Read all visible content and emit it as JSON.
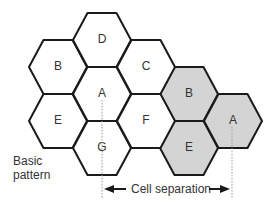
{
  "diagram": {
    "type": "hexagonal cellular frequency reuse pattern",
    "colors": {
      "cell_stroke": "#1a1a1a",
      "basic_fill": "#ffffff",
      "reuse_fill": "#d4d4d4",
      "guide_line": "#999999"
    },
    "cells": [
      {
        "id": "B",
        "group": "basic",
        "cx": 58,
        "cy": 67
      },
      {
        "id": "E",
        "group": "basic",
        "cx": 58,
        "cy": 121
      },
      {
        "id": "D",
        "group": "basic",
        "cx": 102,
        "cy": 40
      },
      {
        "id": "A",
        "group": "basic",
        "cx": 102,
        "cy": 94
      },
      {
        "id": "G",
        "group": "basic",
        "cx": 102,
        "cy": 148
      },
      {
        "id": "C",
        "group": "basic",
        "cx": 146,
        "cy": 67
      },
      {
        "id": "F",
        "group": "basic",
        "cx": 146,
        "cy": 121
      },
      {
        "id": "B",
        "group": "reuse",
        "cx": 189,
        "cy": 94
      },
      {
        "id": "E",
        "group": "reuse",
        "cx": 189,
        "cy": 148
      },
      {
        "id": "A",
        "group": "reuse",
        "cx": 233,
        "cy": 121
      }
    ],
    "labels": {
      "basic_pattern_line1": "Basic",
      "basic_pattern_line2": "pattern",
      "cell_separation": "Cell separation"
    }
  }
}
